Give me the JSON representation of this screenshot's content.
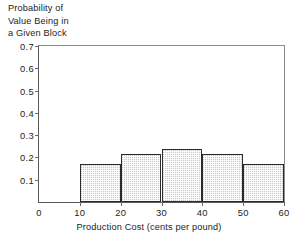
{
  "chart_data": {
    "type": "bar",
    "title": "",
    "ylabel": "Probability of\nValue Being in\na Given Block",
    "xlabel": "Production Cost (cents per pound)",
    "categories": [
      "10-20",
      "20-30",
      "30-40",
      "40-50",
      "50-60"
    ],
    "bin_edges": [
      10,
      20,
      30,
      40,
      50,
      60
    ],
    "values": [
      0.17,
      0.215,
      0.24,
      0.215,
      0.17
    ],
    "xlim": [
      0,
      60
    ],
    "ylim": [
      0,
      0.7
    ],
    "x_ticks": [
      "0",
      "10",
      "20",
      "30",
      "40",
      "50",
      "60"
    ],
    "x_tick_values": [
      0,
      10,
      20,
      30,
      40,
      50,
      60
    ],
    "y_ticks": [
      "0.1",
      "0.2",
      "0.3",
      "0.4",
      "0.5",
      "0.6",
      "0.7"
    ],
    "y_tick_values": [
      0.1,
      0.2,
      0.3,
      0.4,
      0.5,
      0.6,
      0.7
    ],
    "grid": false,
    "legend": null,
    "bar_fill_color": "#c8c8c8",
    "bar_edge_color": "#2b2b2b",
    "axis_color": "#5a5a5a",
    "background_color": "#ffffff"
  }
}
